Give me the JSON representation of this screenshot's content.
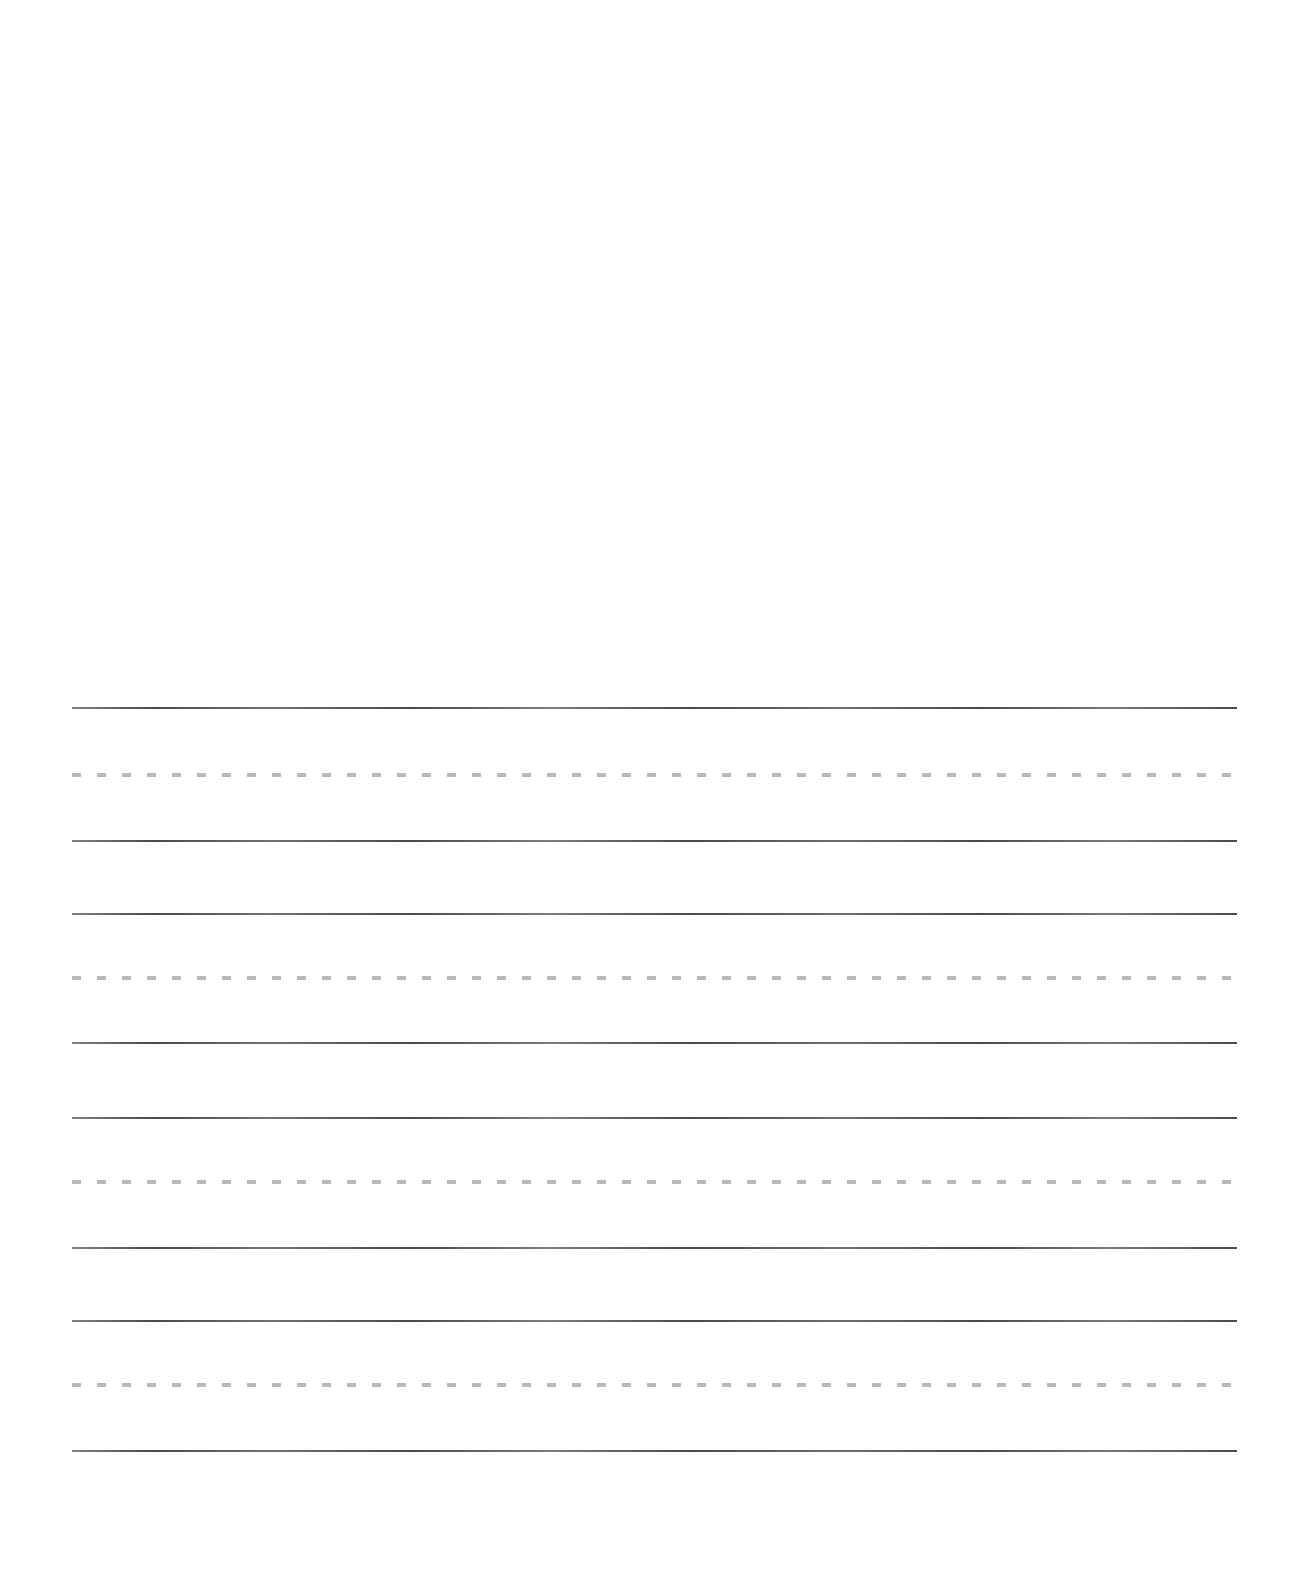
{
  "page": {
    "width": 1307,
    "height": 1573,
    "background_color": "#ffffff",
    "paper_type": "penmanship-ruled",
    "orientation": "portrait"
  },
  "rules": {
    "left": 72,
    "right": 1237,
    "length": 1165,
    "solid_color": "#3b3b3b",
    "solid_thickness": 2,
    "dashed_color": "#b9b9b9",
    "dashed_thickness": 4,
    "dash_length": 9,
    "dash_gap": 16
  },
  "top_margin": {
    "height": 700,
    "content": ""
  },
  "line_groups": [
    {
      "index": 1,
      "top_rule_y": 707,
      "mid_rule_y": 775,
      "base_rule_y": 840,
      "written_text": ""
    },
    {
      "index": 2,
      "top_rule_y": 913,
      "mid_rule_y": 978,
      "base_rule_y": 1042,
      "written_text": ""
    },
    {
      "index": 3,
      "top_rule_y": 1117,
      "mid_rule_y": 1182,
      "base_rule_y": 1247,
      "written_text": ""
    },
    {
      "index": 4,
      "top_rule_y": 1320,
      "mid_rule_y": 1385,
      "base_rule_y": 1450,
      "written_text": ""
    }
  ]
}
